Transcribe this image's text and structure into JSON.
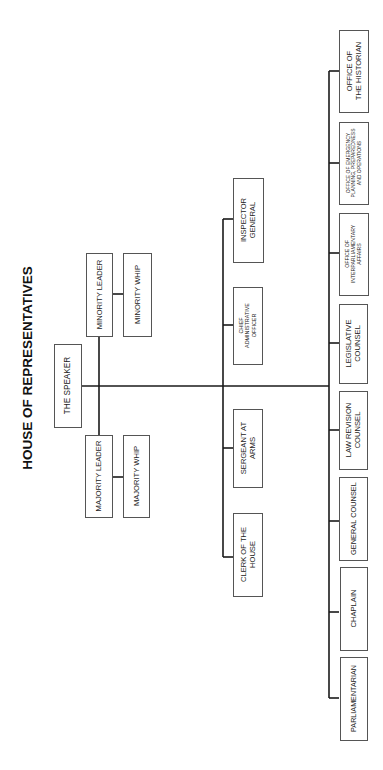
{
  "title": "HOUSE OF REPRESENTATIVES",
  "orientation": "rotated-90-ccw",
  "colors": {
    "line": "#1a1a1a",
    "box_border": "#555555",
    "text": "#222222",
    "background": "#ffffff"
  },
  "leadership": {
    "speaker": {
      "lines": [
        "THE SPEAKER"
      ]
    },
    "majority_leader": {
      "lines": [
        "MAJORITY LEADER"
      ]
    },
    "majority_whip": {
      "lines": [
        "MAJORITY WHIP"
      ]
    },
    "minority_leader": {
      "lines": [
        "MINORITY LEADER"
      ]
    },
    "minority_whip": {
      "lines": [
        "MINORITY WHIP"
      ]
    }
  },
  "officers": [
    {
      "id": "clerk",
      "lines": [
        "CLERK OF THE",
        "HOUSE"
      ]
    },
    {
      "id": "sergeant",
      "lines": [
        "SERGEANT AT",
        "ARMS"
      ]
    },
    {
      "id": "cao",
      "lines": [
        "CHIEF",
        "ADMINISTRATIVE",
        "OFFICER"
      ]
    },
    {
      "id": "ig",
      "lines": [
        "INSPECTOR",
        "GENERAL"
      ]
    }
  ],
  "offices": [
    {
      "id": "parliamentarian",
      "lines": [
        "PARLIAMENTARIAN"
      ]
    },
    {
      "id": "chaplain",
      "lines": [
        "CHAPLAIN"
      ]
    },
    {
      "id": "general-counsel",
      "lines": [
        "GENERAL COUNSEL"
      ]
    },
    {
      "id": "law-revision",
      "lines": [
        "LAW REVISION",
        "COUNSEL"
      ]
    },
    {
      "id": "legislative",
      "lines": [
        "LEGISLATIVE",
        "COUNSEL"
      ]
    },
    {
      "id": "interparliamentary",
      "lines": [
        "OFFICE OF",
        "INTERPARLIAMENTARY",
        "AFFAIRS"
      ]
    },
    {
      "id": "emergency",
      "lines": [
        "OFFICE OF EMERGENCY",
        "PLANNING, PREPAREDNESS",
        "AND OPERATIONS"
      ]
    },
    {
      "id": "historian",
      "lines": [
        "OFFICE OF",
        "THE HISTORIAN"
      ]
    }
  ]
}
